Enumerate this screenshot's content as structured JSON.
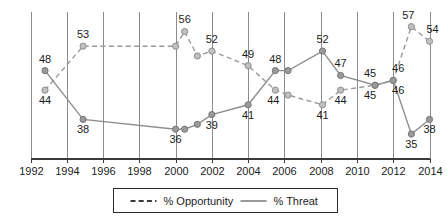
{
  "chart_data": {
    "type": "line",
    "title": "",
    "subtitle": "",
    "xlabel": "",
    "ylabel": "",
    "grid": "vertical-only",
    "legend_position": "bottom-center",
    "xlim": [
      1992,
      2014
    ],
    "ylim": [
      30,
      60
    ],
    "x_ticks": [
      "1992",
      "1994",
      "1996",
      "1998",
      "2000",
      "2002",
      "2004",
      "2006",
      "2008",
      "2010",
      "2012",
      "2014"
    ],
    "y_ticks": [],
    "series": [
      {
        "name": "% Opportunity",
        "style": "dashed",
        "color": "#9a9a9a",
        "marker_color": "#c0c0c0",
        "points": [
          {
            "x": 1992.8,
            "y": 44,
            "label": "44",
            "label_pos": "below"
          },
          {
            "x": 1994.9,
            "y": 53,
            "label": "53",
            "label_pos": "above"
          },
          {
            "x": 2000.0,
            "y": 53,
            "label": "",
            "label_pos": "above"
          },
          {
            "x": 2000.5,
            "y": 56,
            "label": "56",
            "label_pos": "above"
          },
          {
            "x": 2001.2,
            "y": 51,
            "label": "",
            "label_pos": "above"
          },
          {
            "x": 2002.0,
            "y": 52,
            "label": "52",
            "label_pos": "above"
          },
          {
            "x": 2004.0,
            "y": 49,
            "label": "49",
            "label_pos": "above"
          },
          {
            "x": 2005.5,
            "y": 44,
            "label": "44",
            "label_pos": "below"
          },
          {
            "x": 2006.2,
            "y": 43,
            "label": "",
            "label_pos": "below"
          },
          {
            "x": 2008.1,
            "y": 41,
            "label": "41",
            "label_pos": "below"
          },
          {
            "x": 2009.1,
            "y": 44,
            "label": "44",
            "label_pos": "below"
          },
          {
            "x": 2011.0,
            "y": 45,
            "label": "45",
            "label_pos": "below"
          },
          {
            "x": 2012.0,
            "y": 46,
            "label": "46",
            "label_pos": "below"
          },
          {
            "x": 2013.0,
            "y": 57,
            "label": "57",
            "label_pos": "above"
          },
          {
            "x": 2014.0,
            "y": 54,
            "label": "54",
            "label_pos": "above"
          }
        ]
      },
      {
        "name": "% Threat",
        "style": "solid",
        "color": "#8e8e8e",
        "marker_color": "#9a9a9a",
        "points": [
          {
            "x": 1992.8,
            "y": 48,
            "label": "48",
            "label_pos": "above"
          },
          {
            "x": 1994.9,
            "y": 38,
            "label": "38",
            "label_pos": "below"
          },
          {
            "x": 2000.0,
            "y": 36,
            "label": "36",
            "label_pos": "below"
          },
          {
            "x": 2000.5,
            "y": 36,
            "label": "",
            "label_pos": "below"
          },
          {
            "x": 2001.2,
            "y": 37,
            "label": "",
            "label_pos": "below"
          },
          {
            "x": 2002.0,
            "y": 39,
            "label": "39",
            "label_pos": "below"
          },
          {
            "x": 2004.0,
            "y": 41,
            "label": "41",
            "label_pos": "below"
          },
          {
            "x": 2005.5,
            "y": 48,
            "label": "48",
            "label_pos": "above"
          },
          {
            "x": 2006.2,
            "y": 48,
            "label": "",
            "label_pos": "above"
          },
          {
            "x": 2008.1,
            "y": 52,
            "label": "52",
            "label_pos": "above"
          },
          {
            "x": 2009.1,
            "y": 47,
            "label": "47",
            "label_pos": "above"
          },
          {
            "x": 2011.0,
            "y": 45,
            "label": "45",
            "label_pos": "above"
          },
          {
            "x": 2012.0,
            "y": 46,
            "label": "46",
            "label_pos": "above"
          },
          {
            "x": 2013.0,
            "y": 35,
            "label": "35",
            "label_pos": "below"
          },
          {
            "x": 2014.0,
            "y": 38,
            "label": "38",
            "label_pos": "below"
          }
        ]
      }
    ],
    "legend": [
      {
        "label": "% Opportunity",
        "style": "dashed"
      },
      {
        "label": "% Threat",
        "style": "solid"
      }
    ]
  }
}
